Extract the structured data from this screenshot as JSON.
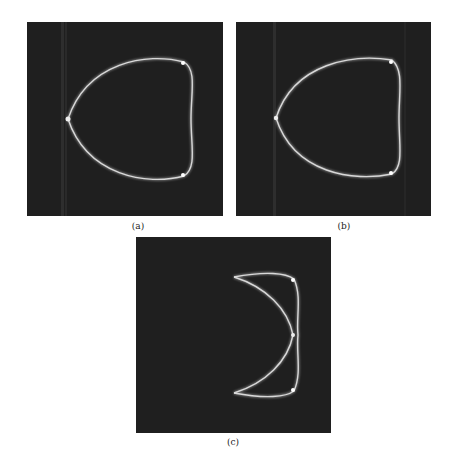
{
  "figure": {
    "panels": [
      {
        "id": "a",
        "caption": "(a)",
        "description": "Bright closed curved contour (teardrop/heart shape) with cusp on left, on dark noisy background"
      },
      {
        "id": "b",
        "caption": "(b)",
        "description": "Similar bright closed contour, slightly different reconstruction"
      },
      {
        "id": "c",
        "caption": "(c)",
        "description": "Right half of contour only, showing two arcs meeting at a point on the right"
      }
    ],
    "colors": {
      "background": "#1f1f1f",
      "curve": "#d8d8d8",
      "page": "#ffffff"
    }
  }
}
